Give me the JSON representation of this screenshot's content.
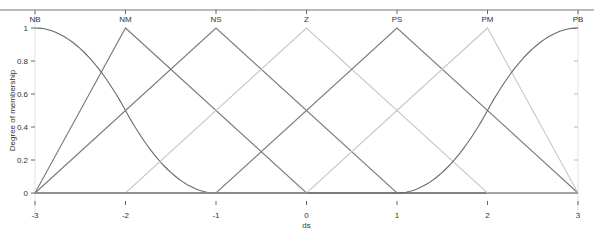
{
  "chart_data": {
    "type": "line",
    "title": "",
    "xlabel": "ds",
    "ylabel": "Degree of membership",
    "xlim": [
      -3,
      3
    ],
    "ylim": [
      0,
      1
    ],
    "x_ticks": [
      "-3",
      "-2",
      "-1",
      "0",
      "1",
      "2",
      "3"
    ],
    "y_ticks": [
      "0",
      "0.2",
      "0.4",
      "0.6",
      "0.8",
      "1"
    ],
    "grid": false,
    "legend": "none (labels placed above peaks)",
    "series": [
      {
        "name": "NB",
        "shape": "zmf",
        "params": [
          -3,
          -1
        ],
        "color": "#6a6a6a",
        "x": [
          -3,
          -2.5,
          -2,
          -1.5,
          -1
        ],
        "y": [
          1,
          0.875,
          0.5,
          0.125,
          0
        ]
      },
      {
        "name": "NM",
        "shape": "trimf",
        "params": [
          -3,
          -2,
          0
        ],
        "color": "#7a7a7a",
        "x": [
          -3,
          -2,
          0
        ],
        "y": [
          0,
          1,
          0
        ]
      },
      {
        "name": "NS",
        "shape": "trimf",
        "params": [
          -3,
          -1,
          1
        ],
        "color": "#7a7a7a",
        "x": [
          -3,
          -1,
          1
        ],
        "y": [
          0,
          1,
          0
        ]
      },
      {
        "name": "Z",
        "shape": "trimf",
        "params": [
          -2,
          0,
          2
        ],
        "color": "#c8c8c8",
        "x": [
          -2,
          0,
          2
        ],
        "y": [
          0,
          1,
          0
        ]
      },
      {
        "name": "PS",
        "shape": "trimf",
        "params": [
          -1,
          1,
          3
        ],
        "color": "#7a7a7a",
        "x": [
          -1,
          1,
          3
        ],
        "y": [
          0,
          1,
          0
        ]
      },
      {
        "name": "PM",
        "shape": "trimf",
        "params": [
          0,
          2,
          3
        ],
        "color": "#c8c8c8",
        "x": [
          0,
          2,
          3
        ],
        "y": [
          0,
          1,
          0
        ]
      },
      {
        "name": "PB",
        "shape": "smf",
        "params": [
          1,
          3
        ],
        "color": "#6a6a6a",
        "x": [
          1,
          1.5,
          2,
          2.5,
          3
        ],
        "y": [
          0,
          0.125,
          0.5,
          0.875,
          1
        ]
      }
    ]
  }
}
